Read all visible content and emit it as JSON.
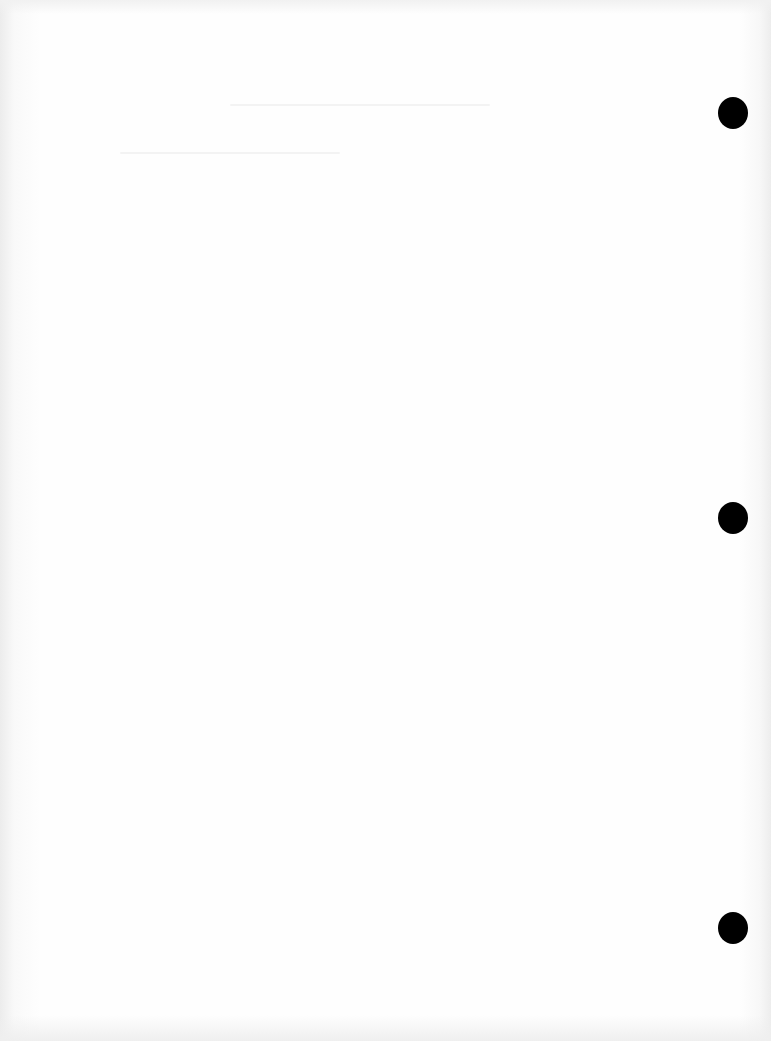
{
  "document": {
    "type": "blank scanned page",
    "text": "",
    "punch_holes": [
      {
        "x": 718,
        "y": 97
      },
      {
        "x": 718,
        "y": 502
      },
      {
        "x": 718,
        "y": 912
      }
    ]
  }
}
